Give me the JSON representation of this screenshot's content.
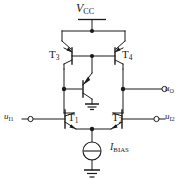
{
  "figure": {
    "kind": "circuit-schematic",
    "background_color": "#ffffff",
    "line_color": "#1a1a1a"
  },
  "labels": {
    "supply": {
      "symbol": "V",
      "subscript": "CC",
      "text": "VCC"
    },
    "t3": {
      "symbol": "T",
      "subscript": "3",
      "text": "T3"
    },
    "t4": {
      "symbol": "T",
      "subscript": "4",
      "text": "T4"
    },
    "t1": {
      "symbol": "T",
      "subscript": "1",
      "text": "T1"
    },
    "t2": {
      "symbol": "T",
      "subscript": "2",
      "text": "T2"
    },
    "bias_current": {
      "symbol": "I",
      "subscript": "BIAS",
      "text": "IBIAS"
    },
    "input_1": {
      "symbol": "u",
      "subscript": "I1",
      "text": "uI1"
    },
    "input_2": {
      "symbol": "u",
      "subscript": "I2",
      "text": "uI2"
    },
    "output": {
      "symbol": "u",
      "subscript": "O",
      "text": "uO"
    }
  },
  "components": [
    {
      "id": "t3",
      "type": "pnp-transistor",
      "label": "T3",
      "role": "current-mirror-load-left"
    },
    {
      "id": "t4",
      "type": "pnp-transistor",
      "label": "T4",
      "role": "current-mirror-load-right"
    },
    {
      "id": "t1",
      "type": "npn-transistor",
      "label": "T1",
      "role": "differential-pair-left"
    },
    {
      "id": "t2",
      "type": "npn-transistor",
      "label": "T2",
      "role": "differential-pair-right"
    },
    {
      "id": "tm",
      "type": "npn-transistor",
      "label": "",
      "role": "mirror-buffer-emitter-grounded"
    },
    {
      "id": "ibias",
      "type": "current-source",
      "label": "IBIAS",
      "role": "tail-current-source"
    }
  ],
  "terminals": [
    {
      "id": "input-1",
      "label": "uI1",
      "side": "left"
    },
    {
      "id": "input-2",
      "label": "uI2",
      "side": "right"
    },
    {
      "id": "output",
      "label": "uO",
      "side": "right"
    }
  ],
  "grounds": [
    {
      "id": "ground-mirror-buffer"
    },
    {
      "id": "ground-bias-source"
    }
  ]
}
